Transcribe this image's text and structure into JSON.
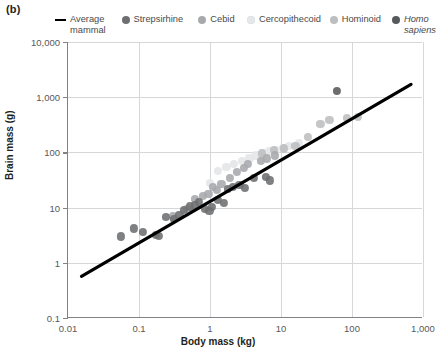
{
  "panel_label": "(b)",
  "legend": {
    "entries": [
      {
        "label": "Average mammal",
        "marker": "line",
        "color": "#000000"
      },
      {
        "label": "Strepsirhine",
        "marker": "circle",
        "color": "#6d6e70"
      },
      {
        "label": "Cebid",
        "marker": "circle",
        "color": "#a7a9ac"
      },
      {
        "label": "Cercopithecoid",
        "marker": "circle",
        "color": "#e6e7e8"
      },
      {
        "label": "Hominoid",
        "marker": "circle",
        "color": "#bcbec0"
      },
      {
        "label": "Homo sapiens",
        "marker": "circle",
        "color": "#58595b",
        "italic": true
      }
    ]
  },
  "chart_data": {
    "type": "scatter",
    "title": "",
    "xlabel": "Body mass (kg)",
    "ylabel": "Brain mass (g)",
    "xscale": "log",
    "yscale": "log",
    "xlim": [
      0.01,
      1000
    ],
    "ylim": [
      0.1,
      10000
    ],
    "xticks": [
      0.01,
      0.1,
      1,
      10,
      100,
      1000
    ],
    "xticklabels": [
      "0.01",
      "0.1",
      "1",
      "10",
      "100",
      "1,000"
    ],
    "yticks": [
      0.1,
      1,
      10,
      100,
      1000,
      10000
    ],
    "yticklabels": [
      "0.1",
      "1",
      "10",
      "100",
      "1,000",
      "10,000"
    ],
    "grid": "both",
    "legend_position": "top",
    "trendline": {
      "name": "Average mammal",
      "color": "#000000",
      "width": 3.2,
      "x": [
        0.0155,
        700
      ],
      "y": [
        0.55,
        1700
      ]
    },
    "series": [
      {
        "name": "Strepsirhine",
        "color": "#6d6e70",
        "points": [
          [
            0.055,
            3.0
          ],
          [
            0.085,
            4.2
          ],
          [
            0.115,
            3.6
          ],
          [
            0.175,
            3.2
          ],
          [
            0.19,
            3.1
          ],
          [
            0.24,
            6.8
          ],
          [
            0.31,
            6.2
          ],
          [
            0.37,
            7.4
          ],
          [
            0.43,
            9.0
          ],
          [
            0.52,
            10.5
          ],
          [
            0.62,
            11.0
          ],
          [
            0.7,
            12.5
          ],
          [
            0.85,
            9.4
          ],
          [
            0.98,
            8.6
          ],
          [
            1.05,
            10.2
          ],
          [
            1.3,
            13.8
          ],
          [
            1.55,
            12.0
          ],
          [
            1.8,
            22.0
          ],
          [
            2.1,
            24.0
          ],
          [
            2.6,
            25.5
          ],
          [
            3.1,
            23.0
          ],
          [
            4.2,
            34.0
          ],
          [
            6.2,
            36.0
          ],
          [
            6.9,
            31.0
          ]
        ]
      },
      {
        "name": "Cebid",
        "color": "#a7a9ac",
        "points": [
          [
            0.3,
            6.9
          ],
          [
            0.48,
            9.6
          ],
          [
            0.62,
            14.5
          ],
          [
            0.8,
            16.5
          ],
          [
            0.95,
            17.5
          ],
          [
            1.1,
            24.0
          ],
          [
            1.25,
            21.0
          ],
          [
            1.45,
            27.0
          ],
          [
            1.9,
            34.0
          ],
          [
            2.4,
            44.0
          ],
          [
            3.0,
            52.0
          ],
          [
            3.4,
            62.0
          ],
          [
            5.2,
            70.0
          ],
          [
            6.3,
            78.0
          ],
          [
            8.2,
            88.0
          ]
        ]
      },
      {
        "name": "Cercopithecoid",
        "color": "#e6e7e8",
        "points": [
          [
            1.0,
            28.0
          ],
          [
            1.3,
            46.0
          ],
          [
            1.7,
            55.0
          ],
          [
            2.2,
            62.0
          ],
          [
            2.8,
            70.0
          ],
          [
            3.6,
            78.0
          ],
          [
            4.4,
            88.0
          ],
          [
            5.5,
            97.0
          ],
          [
            6.8,
            105.0
          ],
          [
            8.5,
            110.0
          ],
          [
            10.5,
            120.0
          ],
          [
            13.0,
            130.0
          ],
          [
            18.0,
            145.0
          ]
        ]
      },
      {
        "name": "Hominoid",
        "color": "#bcbec0",
        "points": [
          [
            5.4,
            96.0
          ],
          [
            8.0,
            110.0
          ],
          [
            11.0,
            118.0
          ],
          [
            16.0,
            130.0
          ],
          [
            24.0,
            190.0
          ],
          [
            36.0,
            330.0
          ],
          [
            48.0,
            390.0
          ],
          [
            85.0,
            420.0
          ],
          [
            120.0,
            440.0
          ]
        ]
      },
      {
        "name": "Homo sapiens",
        "color": "#58595b",
        "points": [
          [
            62.0,
            1300.0
          ]
        ]
      }
    ]
  }
}
